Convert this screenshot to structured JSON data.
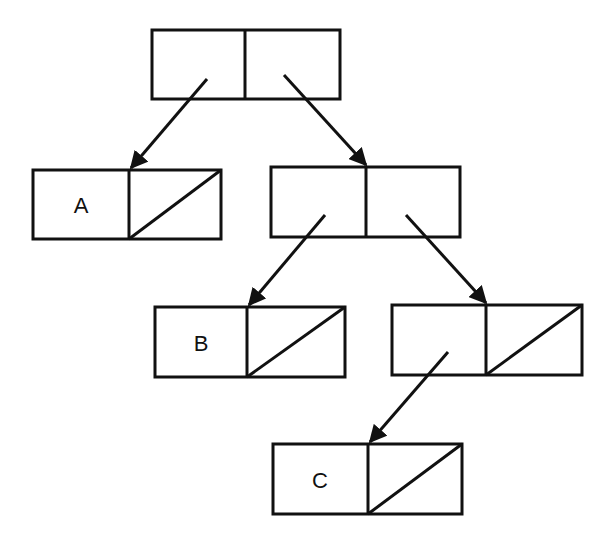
{
  "diagram": {
    "type": "box-and-pointer",
    "stroke_color": "#111111",
    "background": "#ffffff",
    "cells": [
      {
        "id": "root",
        "car": "pointer",
        "cdr": "pointer",
        "car_label": "",
        "cdr_label": ""
      },
      {
        "id": "cellA",
        "car": "atom",
        "cdr": "nil",
        "car_label": "A"
      },
      {
        "id": "cell2",
        "car": "pointer",
        "cdr": "pointer",
        "car_label": "",
        "cdr_label": ""
      },
      {
        "id": "cellB",
        "car": "atom",
        "cdr": "nil",
        "car_label": "B"
      },
      {
        "id": "cell3",
        "car": "pointer",
        "cdr": "nil",
        "car_label": ""
      },
      {
        "id": "cellC",
        "car": "atom",
        "cdr": "nil",
        "car_label": "C"
      }
    ],
    "edges": [
      {
        "from": "root.car",
        "to": "cellA"
      },
      {
        "from": "root.cdr",
        "to": "cell2"
      },
      {
        "from": "cell2.car",
        "to": "cellB"
      },
      {
        "from": "cell2.cdr",
        "to": "cell3"
      },
      {
        "from": "cell3.car",
        "to": "cellC"
      }
    ],
    "labels": {
      "a": "A",
      "b": "B",
      "c": "C"
    }
  }
}
